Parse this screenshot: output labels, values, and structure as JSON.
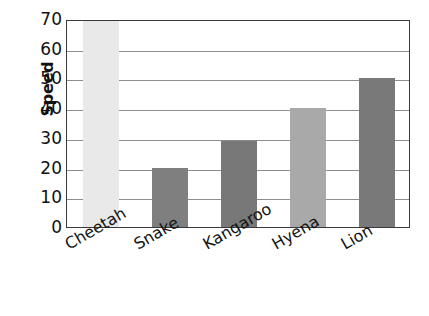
{
  "chart_data": {
    "type": "bar",
    "title": "",
    "xlabel": "",
    "ylabel": "Speed",
    "categories": [
      "Cheetah",
      "Snake",
      "Kangaroo",
      "Hyena",
      "Lion"
    ],
    "values": [
      70,
      20,
      29,
      40,
      50
    ],
    "bar_colors": [
      "#e9e9e9",
      "#7f7f7f",
      "#787878",
      "#a9a9a9",
      "#797979"
    ],
    "ylim": [
      0,
      70
    ],
    "ytick_values": [
      0,
      10,
      20,
      30,
      40,
      50,
      60,
      70
    ],
    "ytick_labels": [
      "0",
      "10",
      "20",
      "30",
      "40",
      "50",
      "60",
      "70"
    ],
    "grid": true,
    "legend": "none"
  },
  "axes": {
    "y_title": "Speed",
    "plot_border_color": "#3a3a3a",
    "gridline_color": "#8d8d8d",
    "background": "#ffffff"
  }
}
